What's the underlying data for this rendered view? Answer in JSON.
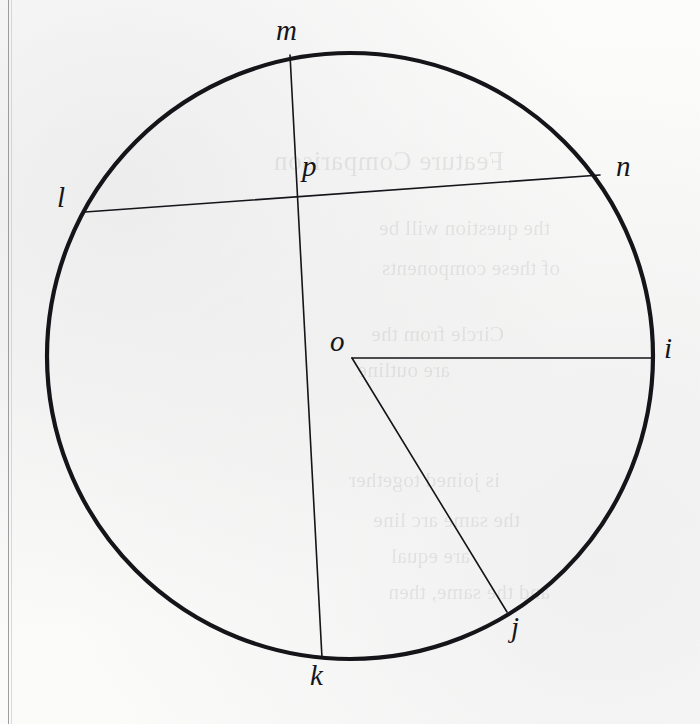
{
  "figure": {
    "kind": "circle-geometry-diagram",
    "caption": "",
    "ink_color": "#141419",
    "paper_color": "#fbfbfa",
    "margin_rule_color": "#8c8c90"
  },
  "circle": {
    "center_label": "o",
    "center_x": 350,
    "center_y": 356,
    "radius": 303,
    "stroke_width": 4.2
  },
  "points": [
    {
      "id": "m",
      "label": "m",
      "x": 290,
      "y": 55,
      "label_x": 276,
      "label_y": 16,
      "on": "circumference"
    },
    {
      "id": "n",
      "label": "n",
      "x": 600,
      "y": 175,
      "label_x": 616,
      "label_y": 152,
      "on": "circumference"
    },
    {
      "id": "i",
      "label": "i",
      "x": 651,
      "y": 358,
      "label_x": 664,
      "label_y": 334,
      "on": "circumference"
    },
    {
      "id": "j",
      "label": "j",
      "x": 507,
      "y": 612,
      "label_x": 511,
      "label_y": 613,
      "on": "circumference"
    },
    {
      "id": "k",
      "label": "k",
      "x": 322,
      "y": 658,
      "label_x": 310,
      "label_y": 661,
      "on": "circumference"
    },
    {
      "id": "l",
      "label": "l",
      "x": 85,
      "y": 212,
      "label_x": 57,
      "label_y": 183,
      "on": "circumference"
    },
    {
      "id": "o",
      "label": "o",
      "x": 352,
      "y": 358,
      "label_x": 330,
      "label_y": 327,
      "on": "center"
    },
    {
      "id": "p",
      "label": "p",
      "x": 298,
      "y": 198,
      "label_x": 302,
      "label_y": 152,
      "on": "intersection"
    }
  ],
  "segments": [
    {
      "id": "chord-m-k",
      "from": "m",
      "to": "k",
      "kind": "chord",
      "stroke_width": 1.6
    },
    {
      "id": "chord-l-n",
      "from": "l",
      "to": "n",
      "kind": "chord",
      "stroke_width": 1.6
    },
    {
      "id": "radius-o-i",
      "from": "o",
      "to": "i",
      "kind": "radius",
      "stroke_width": 1.6
    },
    {
      "id": "radius-o-j",
      "from": "o",
      "to": "j",
      "kind": "radius",
      "stroke_width": 1.6
    }
  ],
  "bleed_through": [
    {
      "text": "Feature Comparison",
      "x": 196,
      "y": 146,
      "style": "bt-head"
    },
    {
      "text": "the question will be",
      "x": 150,
      "y": 216,
      "style": "bt-body"
    },
    {
      "text": "of these components",
      "x": 140,
      "y": 256,
      "style": "bt-body"
    },
    {
      "text": "Circle from the",
      "x": 196,
      "y": 322,
      "style": "bt-body"
    },
    {
      "text": "are outline",
      "x": 250,
      "y": 358,
      "style": "bt-body"
    },
    {
      "text": "is joined together",
      "x": 200,
      "y": 468,
      "style": "bt-body"
    },
    {
      "text": "the same arc line",
      "x": 180,
      "y": 508,
      "style": "bt-body"
    },
    {
      "text": "are equal",
      "x": 230,
      "y": 544,
      "style": "bt-body"
    },
    {
      "text": "and the same, then",
      "x": 150,
      "y": 580,
      "style": "bt-body"
    }
  ]
}
